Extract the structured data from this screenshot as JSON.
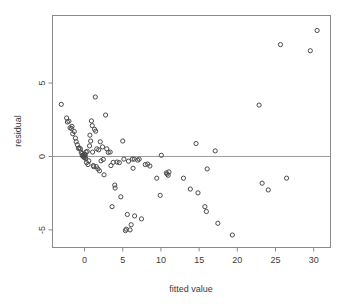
{
  "chart_data": {
    "type": "scatter",
    "title": "",
    "xlabel": "fitted value",
    "ylabel": "residual",
    "xlim": [
      -4.2,
      32.2
    ],
    "ylim": [
      -6.2,
      9.6
    ],
    "xticks": [
      0,
      5,
      10,
      15,
      20,
      25,
      30
    ],
    "xtick_labels": [
      "0",
      "5",
      "10",
      "15",
      "20",
      "25",
      "30"
    ],
    "yticks": [
      5,
      0,
      -5
    ],
    "ytick_labels": [
      "5",
      "0",
      "-5"
    ],
    "grid": false,
    "legend": null,
    "annotations": [
      {
        "kind": "reference-line",
        "orientation": "horizontal",
        "value": 0
      }
    ],
    "marker": {
      "shape": "open-circle",
      "radius": 2.1,
      "color": "#4a4a4a"
    },
    "points": [
      [
        -3.05,
        3.55
      ],
      [
        -2.35,
        2.62
      ],
      [
        -2.25,
        2.35
      ],
      [
        -2.05,
        2.4
      ],
      [
        -1.9,
        1.95
      ],
      [
        -1.7,
        1.9
      ],
      [
        -1.65,
        2.05
      ],
      [
        -1.55,
        1.55
      ],
      [
        -1.35,
        1.7
      ],
      [
        -1.2,
        1.25
      ],
      [
        -1.1,
        1.0
      ],
      [
        -0.95,
        0.8
      ],
      [
        -0.8,
        0.55
      ],
      [
        -0.7,
        0.58
      ],
      [
        -0.55,
        0.52
      ],
      [
        -0.45,
        0.3
      ],
      [
        -0.35,
        0.2
      ],
      [
        -0.3,
        0.05
      ],
      [
        -0.2,
        0.1
      ],
      [
        -0.15,
        0.0
      ],
      [
        -0.1,
        -0.05
      ],
      [
        -0.05,
        0.15
      ],
      [
        0.0,
        0.02
      ],
      [
        0.05,
        -0.08
      ],
      [
        0.1,
        0.12
      ],
      [
        0.15,
        -0.15
      ],
      [
        0.2,
        0.3
      ],
      [
        0.25,
        -0.42
      ],
      [
        0.35,
        0.35
      ],
      [
        0.45,
        -0.55
      ],
      [
        0.55,
        -0.3
      ],
      [
        0.65,
        0.72
      ],
      [
        0.7,
        1.45
      ],
      [
        0.8,
        1.05
      ],
      [
        0.9,
        2.42
      ],
      [
        1.0,
        2.1
      ],
      [
        1.05,
        0.3
      ],
      [
        1.15,
        -0.62
      ],
      [
        1.2,
        -0.7
      ],
      [
        1.3,
        1.85
      ],
      [
        1.4,
        4.05
      ],
      [
        1.45,
        1.72
      ],
      [
        1.55,
        -0.7
      ],
      [
        1.6,
        0.52
      ],
      [
        1.75,
        -0.85
      ],
      [
        1.85,
        0.45
      ],
      [
        1.95,
        -0.98
      ],
      [
        2.05,
        1.0
      ],
      [
        2.15,
        -0.3
      ],
      [
        2.35,
        0.65
      ],
      [
        2.45,
        -0.2
      ],
      [
        2.55,
        -1.25
      ],
      [
        2.75,
        2.82
      ],
      [
        2.9,
        0.52
      ],
      [
        3.1,
        0.28
      ],
      [
        3.35,
        0.3
      ],
      [
        3.45,
        -0.62
      ],
      [
        3.6,
        -3.42
      ],
      [
        3.75,
        -0.4
      ],
      [
        3.95,
        -1.95
      ],
      [
        4.0,
        -2.15
      ],
      [
        4.25,
        -0.38
      ],
      [
        4.55,
        -0.42
      ],
      [
        4.75,
        -2.75
      ],
      [
        5.0,
        1.05
      ],
      [
        5.15,
        -0.18
      ],
      [
        5.35,
        -5.05
      ],
      [
        5.45,
        -4.95
      ],
      [
        5.6,
        -3.95
      ],
      [
        5.75,
        -0.32
      ],
      [
        5.95,
        -5.0
      ],
      [
        6.1,
        -4.65
      ],
      [
        6.25,
        -0.18
      ],
      [
        6.35,
        -0.8
      ],
      [
        6.5,
        -0.18
      ],
      [
        6.55,
        -4.05
      ],
      [
        6.95,
        -0.25
      ],
      [
        7.15,
        -0.18
      ],
      [
        7.45,
        -4.25
      ],
      [
        7.95,
        -0.55
      ],
      [
        8.25,
        -0.52
      ],
      [
        8.55,
        -0.65
      ],
      [
        9.45,
        -1.48
      ],
      [
        9.9,
        -2.65
      ],
      [
        10.05,
        0.08
      ],
      [
        10.7,
        -1.12
      ],
      [
        10.8,
        -1.2
      ],
      [
        10.95,
        -1.28
      ],
      [
        11.05,
        -1.05
      ],
      [
        12.95,
        -1.48
      ],
      [
        13.85,
        -2.22
      ],
      [
        14.6,
        0.88
      ],
      [
        14.85,
        -2.48
      ],
      [
        15.75,
        -3.42
      ],
      [
        15.95,
        -3.75
      ],
      [
        16.05,
        -0.85
      ],
      [
        17.1,
        0.38
      ],
      [
        17.45,
        -4.55
      ],
      [
        19.35,
        -5.35
      ],
      [
        22.85,
        3.5
      ],
      [
        23.25,
        -1.82
      ],
      [
        24.05,
        -2.28
      ],
      [
        25.65,
        7.62
      ],
      [
        26.45,
        -1.48
      ],
      [
        29.55,
        7.2
      ],
      [
        30.45,
        8.58
      ]
    ]
  }
}
